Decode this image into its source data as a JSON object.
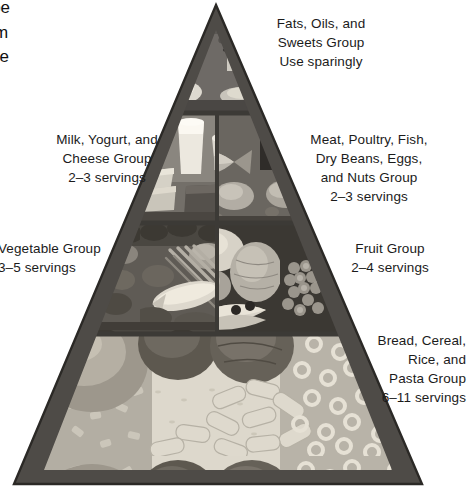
{
  "figure": {
    "kind": "food-guide-pyramid-diagram"
  },
  "surrounding_text": {
    "paragraph_fragment": "would be\nods from\namid like\ntatoes,",
    "orphan_letter": "e"
  },
  "tiers": [
    {
      "id": "tip",
      "name": "fats-oils-sweets",
      "label": "Fats, Oils, and\nSweets Group\nUse sparingly",
      "servings": "Use sparingly",
      "label_align": "center",
      "label_side": "right"
    },
    {
      "id": "tier2-left",
      "name": "milk-yogurt-cheese",
      "label": "Milk, Yogurt, and\nCheese Group\n2–3 servings",
      "servings": "2–3 servings",
      "label_align": "center",
      "label_side": "left"
    },
    {
      "id": "tier2-right",
      "name": "meat-poultry-fish-beans-eggs-nuts",
      "label": "Meat, Poultry, Fish,\nDry Beans, Eggs,\nand Nuts Group\n2–3 servings",
      "servings": "2–3 servings",
      "label_align": "center",
      "label_side": "right"
    },
    {
      "id": "tier3-left",
      "name": "vegetable",
      "label": "Vegetable Group\n3–5 servings",
      "servings": "3–5 servings",
      "label_align": "left",
      "label_side": "left"
    },
    {
      "id": "tier3-right",
      "name": "fruit",
      "label": "Fruit Group\n2–4 servings",
      "servings": "2–4 servings",
      "label_align": "center",
      "label_side": "right"
    },
    {
      "id": "base",
      "name": "bread-cereal-rice-pasta",
      "label": "Bread, Cereal,\nRice, and\nPasta Group\n6–11 servings",
      "servings": "6–11 servings",
      "label_align": "right",
      "label_side": "right"
    }
  ],
  "colors": {
    "edge": "#4b4b4b",
    "edge_dark": "#2e2e2e",
    "photo_mid": "#8f8f8f",
    "photo_dark": "#3d3d3d",
    "photo_light": "#d7d4cd",
    "text": "#1b1b1b",
    "background": "#ffffff"
  }
}
